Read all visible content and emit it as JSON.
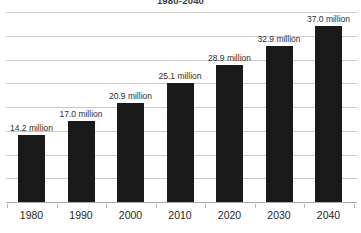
{
  "chart_data": {
    "type": "bar",
    "title": "1980-2040",
    "subtitle": "",
    "xlabel": "",
    "ylabel": "",
    "categories": [
      "1980",
      "1990",
      "2000",
      "2010",
      "2020",
      "2030",
      "2040"
    ],
    "values": [
      14.2,
      17.0,
      20.9,
      25.1,
      28.9,
      32.9,
      37.0
    ],
    "data_labels": [
      "14.2 million",
      "17.0 million",
      "20.9 million",
      "25.1 million",
      "28.9 million",
      "32.9 million",
      "37.0 million"
    ],
    "units": "million",
    "ylim": [
      0,
      40
    ],
    "gridlines": [
      5,
      10,
      15,
      20,
      25,
      30,
      35,
      40
    ],
    "grid": true,
    "legend": null,
    "legend_position": "none",
    "series": [
      {
        "name": "Population",
        "values": [
          14.2,
          17.0,
          20.9,
          25.1,
          28.9,
          32.9,
          37.0
        ]
      }
    ],
    "colors": {
      "bar": "#1a1a1a",
      "gridline": "#c9c9c9",
      "axis": "#a8a8a8",
      "label_text": "#2e2e2e",
      "tick_text": "#1f1f1f",
      "background": "#ffffff"
    }
  }
}
